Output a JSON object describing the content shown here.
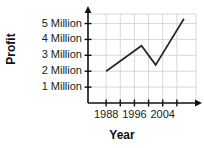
{
  "chart_data": {
    "type": "line",
    "title": "",
    "xlabel": "Year",
    "ylabel": "Profit",
    "grid": true,
    "legend": "none",
    "x": [
      1988,
      1998,
      2002,
      2010
    ],
    "values": [
      2.0,
      3.6,
      2.4,
      5.3
    ],
    "series": [
      {
        "name": "Profit",
        "points": [
          {
            "x": 1988,
            "y": 2.0
          },
          {
            "x": 1998,
            "y": 3.6
          },
          {
            "x": 2002,
            "y": 2.4
          },
          {
            "x": 2010,
            "y": 5.3
          }
        ]
      }
    ],
    "xlim": [
      1984,
      2012
    ],
    "ylim": [
      0,
      5.6
    ],
    "x_tick_values": [
      1988,
      1992,
      1996,
      2000,
      2004,
      2008
    ],
    "x_tick_labels": [
      "1988",
      "1996",
      "2004"
    ],
    "x_labeled_values": [
      1988,
      1996,
      2004
    ],
    "y_tick_values": [
      1,
      2,
      3,
      4,
      5
    ],
    "y_tick_labels": [
      "1 Million",
      "2 Million",
      "3 Million",
      "4 Million",
      "5 Million"
    ],
    "line_color": "#262626",
    "axis_color": "#111111",
    "grid_color": "#d8d8d8",
    "background_color": "#ffffff"
  },
  "axes": {
    "y_title": "Profit",
    "x_title": "Year"
  }
}
